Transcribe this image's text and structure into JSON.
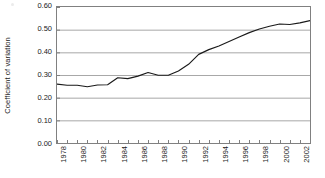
{
  "chart_data": {
    "type": "line",
    "title": "",
    "xlabel": "",
    "ylabel": "Coefficient of variation",
    "ylim": [
      0.0,
      0.6
    ],
    "ytick_labels": [
      "0.60",
      "0.50",
      "0.40",
      "0.30",
      "0.20",
      "0.10",
      "0.00"
    ],
    "ytick_values": [
      0.6,
      0.5,
      0.4,
      0.3,
      0.2,
      0.1,
      0.0
    ],
    "xlim": [
      1978,
      2003
    ],
    "xtick_labels": [
      "1978",
      "1980",
      "1982",
      "1984",
      "1986",
      "1988",
      "1990",
      "1992",
      "1994",
      "1996",
      "1998",
      "2000",
      "2002"
    ],
    "xtick_values": [
      1978,
      1980,
      1982,
      1984,
      1986,
      1988,
      1990,
      1992,
      1994,
      1996,
      1998,
      2000,
      2002
    ],
    "grid": "horizontal",
    "legend": "none",
    "line_color": "#1a1a1a",
    "grid_color": "#a8a8a8",
    "axis_color": "#808080",
    "x": [
      1978,
      1979,
      1980,
      1981,
      1982,
      1983,
      1984,
      1985,
      1986,
      1987,
      1988,
      1989,
      1990,
      1991,
      1992,
      1993,
      1994,
      1995,
      1996,
      1997,
      1998,
      1999,
      2000,
      2001,
      2002,
      2003
    ],
    "values": [
      0.26,
      0.255,
      0.255,
      0.248,
      0.256,
      0.257,
      0.288,
      0.284,
      0.295,
      0.311,
      0.299,
      0.299,
      0.318,
      0.347,
      0.391,
      0.412,
      0.428,
      0.448,
      0.468,
      0.487,
      0.503,
      0.515,
      0.525,
      0.523,
      0.53,
      0.54
    ],
    "series": [
      {
        "name": "Coefficient of variation",
        "values": [
          0.26,
          0.255,
          0.255,
          0.248,
          0.256,
          0.257,
          0.288,
          0.284,
          0.295,
          0.311,
          0.299,
          0.299,
          0.318,
          0.347,
          0.391,
          0.412,
          0.428,
          0.448,
          0.468,
          0.487,
          0.503,
          0.515,
          0.525,
          0.523,
          0.53,
          0.54
        ]
      }
    ]
  }
}
